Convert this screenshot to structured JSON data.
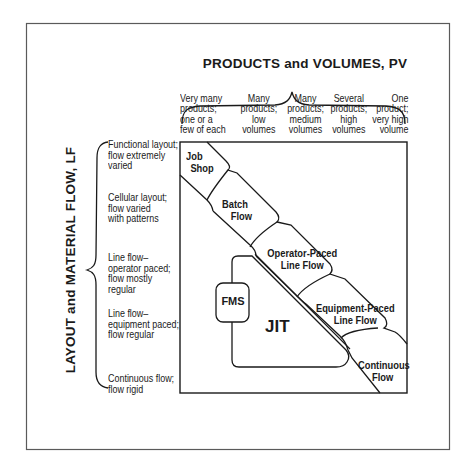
{
  "diagram": {
    "x_axis_title": "PRODUCTS and VOLUMES,  PV",
    "y_axis_title": "LAYOUT and MATERIAL FLOW,  LF",
    "columns": [
      {
        "lines": [
          "Very many",
          "products;",
          "one or a",
          "few of each"
        ]
      },
      {
        "lines": [
          "Many",
          "products;",
          "low",
          "volumes"
        ]
      },
      {
        "lines": [
          "Many",
          "products;",
          "medium",
          "volumes"
        ]
      },
      {
        "lines": [
          "Several",
          "products;",
          "high",
          "volumes"
        ]
      },
      {
        "lines": [
          "One",
          "product;",
          "very high",
          "volume"
        ]
      }
    ],
    "rows": [
      {
        "lines": [
          "Functional layout;",
          "flow extremely",
          "varied"
        ]
      },
      {
        "lines": [
          "Cellular layout;",
          "flow varied",
          "with patterns"
        ]
      },
      {
        "lines": [
          "Line flow–",
          "operator paced;",
          "flow mostly",
          "regular"
        ]
      },
      {
        "lines": [
          "Line flow–",
          "equipment paced;",
          "flow regular"
        ]
      },
      {
        "lines": [
          "Continuous flow;",
          "flow rigid"
        ]
      }
    ],
    "cells": [
      {
        "name": "job-shop",
        "lines": [
          "Job",
          "Shop"
        ]
      },
      {
        "name": "batch-flow",
        "lines": [
          "Batch",
          "Flow"
        ]
      },
      {
        "name": "operator-paced-line-flow",
        "lines": [
          "Operator-Paced",
          "Line Flow"
        ]
      },
      {
        "name": "equipment-paced-line-flow",
        "lines": [
          "Equipment-Paced",
          "Line Flow"
        ]
      },
      {
        "name": "continuous-flow",
        "lines": [
          "Continuous",
          "Flow"
        ]
      }
    ],
    "regions": {
      "jit": "JIT",
      "fms": "FMS"
    },
    "colors": {
      "line": "#1a1a1a",
      "frame": "#555555",
      "background": "#ffffff"
    }
  }
}
